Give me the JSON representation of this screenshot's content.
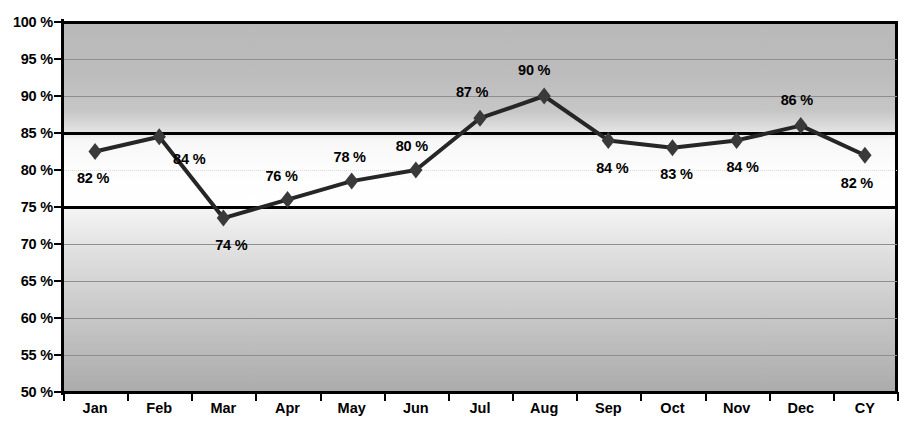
{
  "chart_data": {
    "type": "line",
    "title": "",
    "xlabel": "",
    "ylabel": "",
    "ylim": [
      50,
      100
    ],
    "ytick_step": 5,
    "grid": true,
    "legend": "none",
    "categories": [
      "Jan",
      "Feb",
      "Mar",
      "Apr",
      "May",
      "Jun",
      "Jul",
      "Aug",
      "Sep",
      "Oct",
      "Nov",
      "Dec",
      "CY"
    ],
    "values": [
      82.5,
      84.5,
      73.5,
      76.0,
      78.5,
      80.0,
      87.0,
      90.0,
      84.0,
      83.0,
      84.0,
      86.0,
      82.0
    ],
    "data_labels": [
      "82 %",
      "84 %",
      "74 %",
      "76 %",
      "78 %",
      "80 %",
      "87 %",
      "90 %",
      "84 %",
      "83 %",
      "84 %",
      "86 %",
      "82 %"
    ],
    "ytick_labels": [
      "100 %",
      "95 %",
      "90 %",
      "85 %",
      "80 %",
      "75 %",
      "70 %",
      "65 %",
      "60 %",
      "55 %",
      "50 %"
    ],
    "ytick_values": [
      100,
      95,
      90,
      85,
      80,
      75,
      70,
      65,
      60,
      55,
      50
    ],
    "reference_lines": [
      85,
      75
    ],
    "dotted_gridlines": [
      80
    ],
    "series_name": "",
    "marker": "diamond",
    "colors": {
      "line": "#262626",
      "marker": "#3a3a3a",
      "reference_line": "#000000",
      "gridline": "#8e8e8e",
      "axis": "#000000",
      "label_text": "#000000",
      "plot_background_top": "#b9b9b9",
      "plot_background_mid": "#ffffff",
      "plot_background_bottom": "#ababab"
    }
  }
}
